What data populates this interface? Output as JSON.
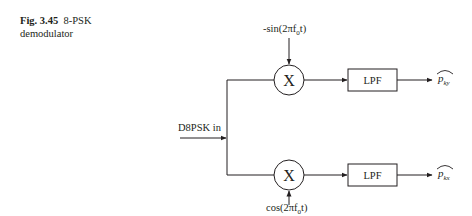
{
  "caption": {
    "label": "Fig. 3.45",
    "title": "8-PSK",
    "title_line2": "demodulator"
  },
  "diagram": {
    "input_label": "D8PSK in",
    "multiplier_symbol": "X",
    "top_branch": {
      "carrier_label": "-sin(2πf0t)",
      "carrier_prefix": "-sin(2πf",
      "carrier_sub": "0",
      "carrier_suffix": "t)",
      "filter_label": "LPF",
      "output_base": "p",
      "output_sub": "ky"
    },
    "bottom_branch": {
      "carrier_label": "cos(2πf0t)",
      "carrier_prefix": "cos(2πf",
      "carrier_sub": "0",
      "carrier_suffix": "t)",
      "filter_label": "LPF",
      "output_base": "p",
      "output_sub": "kx"
    }
  }
}
